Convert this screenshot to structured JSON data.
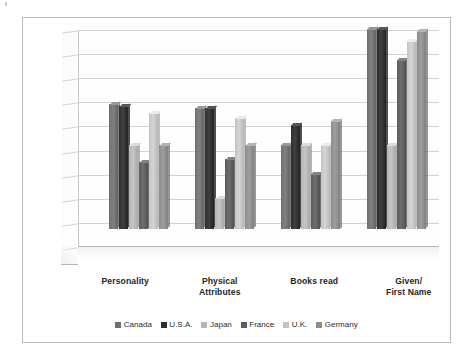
{
  "chart_data": {
    "type": "bar",
    "title": "",
    "subtitle": "",
    "xlabel": "",
    "ylabel": "",
    "ylim": [
      0,
      90
    ],
    "ytick_labels": [
      "0%",
      "10%",
      "20%",
      "30%",
      "40%",
      "50%",
      "60%",
      "70%",
      "80%",
      "90%"
    ],
    "ytick_values": [
      0,
      10,
      20,
      30,
      40,
      50,
      60,
      70,
      80,
      90
    ],
    "grid": true,
    "legend_position": "bottom",
    "categories": [
      "Personality",
      "Physical\nAttributes",
      "Books read",
      "Given/\nFirst Name"
    ],
    "category_lines": [
      [
        "Personality"
      ],
      [
        "Physical",
        "Attributes"
      ],
      [
        "Books read"
      ],
      [
        "Given/",
        "First Name"
      ]
    ],
    "series": [
      {
        "name": "Canada",
        "color": "#6f6f6f",
        "values": [
          52,
          50,
          35,
          83
        ]
      },
      {
        "name": "U.S.A.",
        "color": "#2e2e2e",
        "values": [
          51,
          50,
          43,
          83
        ]
      },
      {
        "name": "Japan",
        "color": "#b4b4b4",
        "values": [
          35,
          13,
          35,
          35
        ]
      },
      {
        "name": "France",
        "color": "#5c5c5c",
        "values": [
          28,
          29,
          23,
          70
        ]
      },
      {
        "name": "U.K.",
        "color": "#c3c3c3",
        "values": [
          48,
          46,
          35,
          78
        ]
      },
      {
        "name": "Germany",
        "color": "#8c8c8c",
        "values": [
          35,
          35,
          45,
          82
        ]
      }
    ]
  },
  "legend": {
    "items": [
      "Canada",
      "U.S.A.",
      "Japan",
      "France",
      "U.K.",
      "Germany"
    ]
  },
  "colors": {
    "frame_border": "#b9b9b9",
    "gridline": "#d2d2d2",
    "axis_text": "#3a3a3a",
    "label_text": "#262626",
    "plot_background": "#fefefe"
  }
}
